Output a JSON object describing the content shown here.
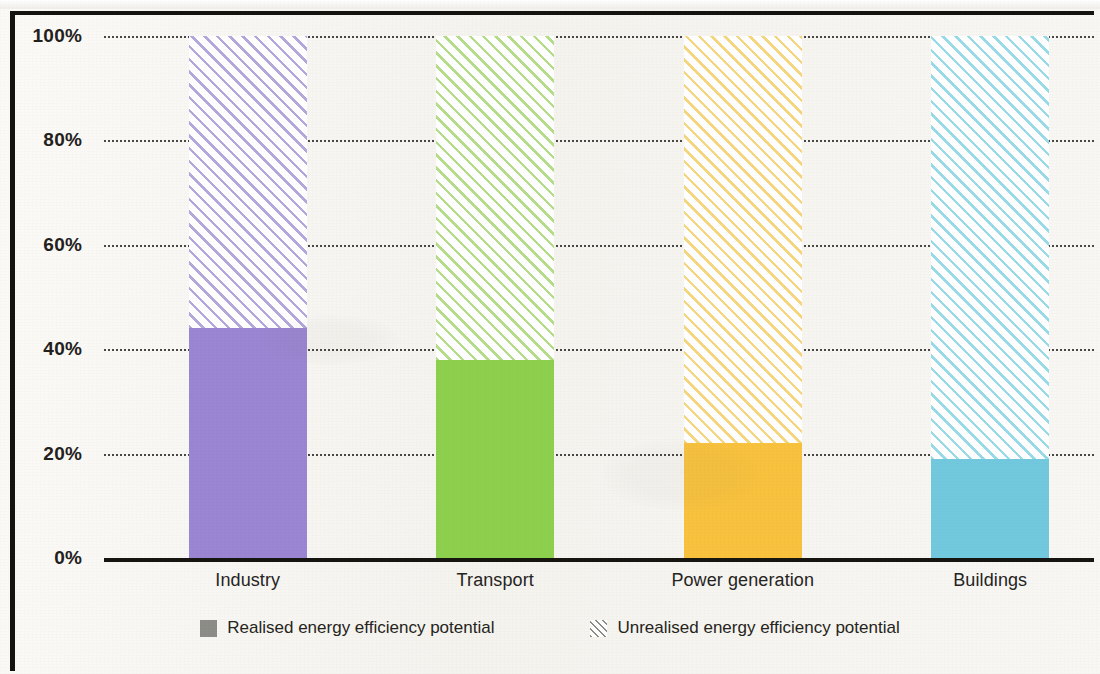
{
  "chart_data": {
    "type": "bar",
    "stacked": true,
    "title": "",
    "subtitle": "",
    "xlabel": "",
    "ylabel": "",
    "categories": [
      "Industry",
      "Transport",
      "Power generation",
      "Buildings"
    ],
    "ylim": [
      0,
      100
    ],
    "ytick_labels": [
      "100%",
      "80%",
      "60%",
      "40%",
      "20%",
      "0%"
    ],
    "ytick_values": [
      100,
      80,
      60,
      40,
      20,
      0
    ],
    "grid": true,
    "grid_style": "dotted-horizontal",
    "legend_position": "bottom-center",
    "series": [
      {
        "name": "Realised energy efficiency potential",
        "style": "solid",
        "values": [
          44,
          38,
          22,
          19
        ]
      },
      {
        "name": "Unrealised energy efficiency potential",
        "style": "diagonal-hatch",
        "values": [
          56,
          62,
          78,
          81
        ]
      }
    ],
    "bar_colors": [
      "#9b86d3",
      "#8ed04e",
      "#f8c23f",
      "#72c9de"
    ],
    "hatch_colors": [
      "#b5a8dd",
      "#b6dd8a",
      "#f6d77f",
      "#9adbe9"
    ]
  },
  "axis": {
    "y_ticks": [
      {
        "label": "100%",
        "value": 100
      },
      {
        "label": "80%",
        "value": 80
      },
      {
        "label": "60%",
        "value": 60
      },
      {
        "label": "40%",
        "value": 40
      },
      {
        "label": "20%",
        "value": 20
      },
      {
        "label": "0%",
        "value": 0
      }
    ],
    "x_categories": [
      {
        "label": "Industry"
      },
      {
        "label": "Transport"
      },
      {
        "label": "Power generation"
      },
      {
        "label": "Buildings"
      }
    ]
  },
  "legend": {
    "items": [
      {
        "label": "Realised energy efficiency potential",
        "swatch": "solid-square-icon"
      },
      {
        "label": "Unrealised energy efficiency potential",
        "swatch": "hatched-square-icon"
      }
    ]
  }
}
